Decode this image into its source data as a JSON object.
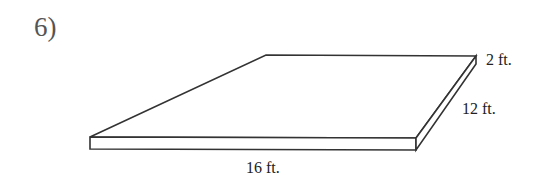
{
  "problem": {
    "number": "6)"
  },
  "figure": {
    "shape": "rectangular prism (slab)",
    "dimensions": {
      "height": "2 ft.",
      "width": "12 ft.",
      "length": "16 ft."
    },
    "stroke_color": "#333333"
  }
}
